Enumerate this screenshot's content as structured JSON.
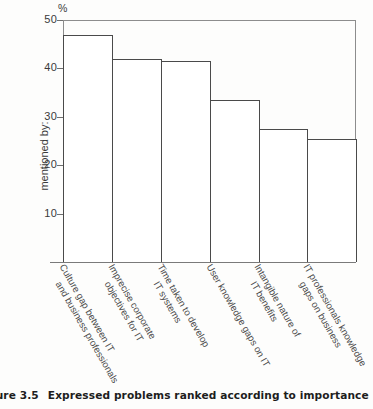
{
  "caption": {
    "number": "gure 3.5",
    "text": "Expressed problems ranked according to importance"
  },
  "axis": {
    "unit_symbol": "%",
    "y_axis_title": "mentioned by:",
    "y_ticks": [
      "10",
      "20",
      "30",
      "40",
      "50"
    ]
  },
  "chart_data": {
    "type": "bar",
    "title": "Expressed problems ranked according to importance",
    "xlabel": "",
    "ylabel": "mentioned by:",
    "unit": "%",
    "ylim": [
      0,
      50
    ],
    "y_ticks": [
      10,
      20,
      30,
      40,
      50
    ],
    "grid": false,
    "legend": "none",
    "orientation": "vertical",
    "categories": [
      "Culture gap between IT and business professionals",
      "Imprecise corporate objectives for IT",
      "Time taken to develop IT systems",
      "User knowledge gaps on IT",
      "Intangible nature of IT benefits",
      "IT professionals knowledge gaps on business"
    ],
    "category_lines": [
      [
        "Culture gap between IT",
        "and business professionals"
      ],
      [
        "Imprecise corporate",
        "objectives for IT"
      ],
      [
        "Time taken to develop",
        "IT systems"
      ],
      [
        "User knowledge gaps on IT",
        ""
      ],
      [
        "Intangible nature of",
        "IT benefits"
      ],
      [
        "IT professionals knowledge",
        "gaps on business"
      ]
    ],
    "values": [
      47,
      42,
      41.5,
      33.5,
      27.5,
      25.5
    ]
  }
}
